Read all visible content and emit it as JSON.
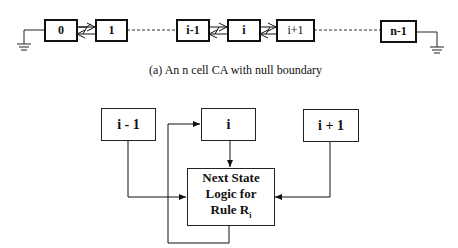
{
  "top_chain": {
    "cells": [
      {
        "label": "0"
      },
      {
        "label": "1"
      },
      {
        "label": "i-1"
      },
      {
        "label": "i"
      },
      {
        "label": "i+1"
      },
      {
        "label": "n-1"
      }
    ],
    "caption": "(a)  An n cell CA with null boundary"
  },
  "bottom_diagram": {
    "left_neighbor": "i - 1",
    "center_cell": "i",
    "right_neighbor": "i + 1",
    "logic_box": {
      "line1": "Next State",
      "line2": "Logic for",
      "line3": "Rule R",
      "line3_sub": "i"
    }
  }
}
